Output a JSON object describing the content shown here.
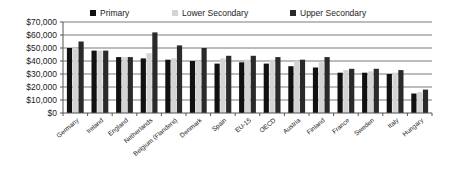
{
  "chart_data": {
    "type": "bar",
    "title": "",
    "xlabel": "",
    "ylabel": "",
    "ylim": [
      0,
      70000
    ],
    "yticks": [
      0,
      10000,
      20000,
      30000,
      40000,
      50000,
      60000,
      70000
    ],
    "ytick_labels": [
      "$0",
      "$10,000",
      "$20,000",
      "$30,000",
      "$40,000",
      "$50,000",
      "$60,000",
      "$70,000"
    ],
    "grid": true,
    "legend_position": "top",
    "categories": [
      "Germany",
      "Ireland",
      "England",
      "Netherlands",
      "Belgium (Flanders)",
      "Denmark",
      "Spain",
      "EU-15",
      "OECD",
      "Austria",
      "Finland",
      "France",
      "Sweden",
      "Italy",
      "Hungary"
    ],
    "series": [
      {
        "name": "Primary",
        "color": "#111111",
        "values": [
          50000,
          48000,
          43000,
          42000,
          41000,
          40000,
          38000,
          39000,
          38000,
          36000,
          35000,
          31000,
          31000,
          30000,
          15000
        ]
      },
      {
        "name": "Lower Secondary",
        "color": "#d4d4d4",
        "values": [
          50000,
          48000,
          43000,
          46000,
          42000,
          40000,
          42000,
          41000,
          41000,
          40000,
          39000,
          33000,
          32000,
          31000,
          16000
        ]
      },
      {
        "name": "Upper Secondary",
        "color": "#2a2a2a",
        "values": [
          55000,
          48000,
          43000,
          62000,
          52000,
          50000,
          44000,
          44000,
          43000,
          41000,
          43000,
          34000,
          34000,
          33000,
          18000
        ]
      }
    ]
  }
}
